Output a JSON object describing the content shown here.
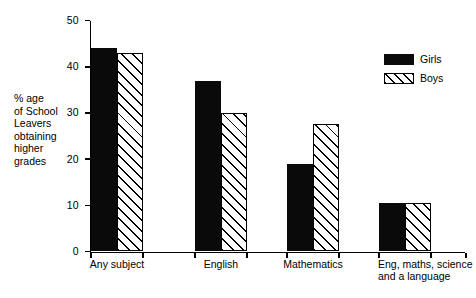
{
  "chart_data": {
    "type": "bar",
    "title": "",
    "xlabel": "",
    "ylabel": "% age\nof School\nLeavers\nobtaining\nhigher\ngrades",
    "categories": [
      "Any subject",
      "English",
      "Mathematics",
      "Eng, maths, science\nand a language"
    ],
    "series": [
      {
        "name": "Girls",
        "values": [
          44,
          37,
          19,
          10.5
        ],
        "fill": "solid",
        "color": "#0a0a0a"
      },
      {
        "name": "Boys",
        "values": [
          43,
          30,
          27.5,
          10.5
        ],
        "fill": "diagonal-hatch",
        "color": "#000000"
      }
    ],
    "ylim": [
      0,
      50
    ],
    "yticks": [
      0,
      10,
      20,
      30,
      40,
      50
    ],
    "ytick_labels": [
      "0",
      "10",
      "20",
      "30",
      "40",
      "50"
    ],
    "grid": false,
    "legend_position": "top-right"
  },
  "legend": {
    "entries": [
      {
        "label": "Girls",
        "style": "solid"
      },
      {
        "label": "Boys",
        "style": "hatch"
      }
    ]
  }
}
